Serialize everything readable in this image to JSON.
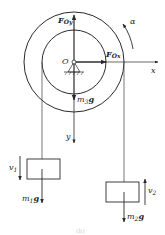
{
  "figure": {
    "caption": "(b)",
    "labels": {
      "origin": "O",
      "F_Oy": "F",
      "F_Oy_sub": "Oy",
      "F_Ox": "F",
      "F_Ox_sub": "Ox",
      "alpha": "α",
      "x_axis": "x",
      "y_axis": "y",
      "m3g_m": "m",
      "m3g_sub": "3",
      "m3g_g": "g",
      "m1g_m": "m",
      "m1g_sub": "1",
      "m1g_g": "g",
      "m2g_m": "m",
      "m2g_sub": "2",
      "m2g_g": "g",
      "v1": "v",
      "v1_sub": "1",
      "v2": "v",
      "v2_sub": "2"
    },
    "colors": {
      "stroke": "#2a2a2a",
      "rope": "#555555",
      "background": "#ffffff"
    }
  }
}
